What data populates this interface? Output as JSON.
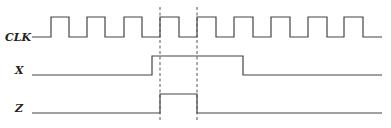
{
  "diagram": {
    "type": "timing-diagram",
    "signals": [
      {
        "name": "CLK",
        "label": "CLK",
        "label_y": 41,
        "high_y": 17,
        "low_y": 37,
        "points": "32,37 51,37 51,17 69,17 69,37 87,37 87,17 105,17 105,37 124,37 124,17 142,17 142,37 160,37 160,17 179,17 179,37 197,37 197,17 216,17 216,37 234,37 234,17 253,17 253,37 271,37 271,17 290,17 290,37 308,37 308,17 327,17 327,37 344,37 344,17 363,17 363,37 382,37"
      },
      {
        "name": "X",
        "label": "X",
        "label_y": 74,
        "high_y": 56,
        "low_y": 75,
        "points": "32,75 152,75 152,56 243,56 243,75 382,75"
      },
      {
        "name": "Z",
        "label": "Z",
        "label_y": 112,
        "high_y": 94,
        "low_y": 113,
        "points": "32,113 160,113 160,94 197,94 197,113 382,113"
      }
    ],
    "markers": [
      {
        "x": 160,
        "y1": 7,
        "y2": 122
      },
      {
        "x": 197,
        "y1": 7,
        "y2": 122
      }
    ],
    "colors": {
      "line": "#444444",
      "background": "#ffffff"
    }
  }
}
